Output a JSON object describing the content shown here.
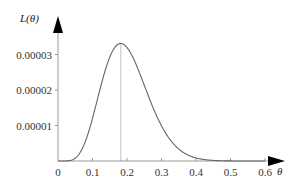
{
  "chart_data": {
    "type": "line",
    "title": "",
    "xlabel": "θ",
    "ylabel": "L(θ)",
    "xlim": [
      0,
      0.63
    ],
    "ylim": [
      0,
      3.7e-05
    ],
    "grid": false,
    "legend": null,
    "x_ticks": [
      0,
      0.1,
      0.2,
      0.3,
      0.4,
      0.5,
      0.6
    ],
    "x_tick_labels": [
      "0",
      "0.1",
      "0.2",
      "0.3",
      "0.4",
      "0.5",
      "0.6"
    ],
    "y_ticks": [
      1e-05,
      2e-05,
      3e-05
    ],
    "y_tick_labels": [
      "0.00001",
      "0.00002",
      "0.00003"
    ],
    "annotations": [
      {
        "type": "vertical-line",
        "x": 0.182,
        "label": "maximum",
        "note": "line from axis to curve peak"
      }
    ],
    "series": [
      {
        "name": "L(θ)",
        "x": [
          0,
          0.02,
          0.04,
          0.05,
          0.06,
          0.08,
          0.1,
          0.12,
          0.14,
          0.16,
          0.18,
          0.182,
          0.2,
          0.22,
          0.24,
          0.26,
          0.28,
          0.3,
          0.32,
          0.34,
          0.36,
          0.38,
          0.4,
          0.42,
          0.44,
          0.46,
          0.48,
          0.5,
          0.55,
          0.6
        ],
        "values": [
          0,
          0.0,
          2e-07,
          8e-07,
          2e-06,
          6.2e-06,
          1.2e-05,
          1.86e-05,
          2.5e-05,
          3e-05,
          3.3e-05,
          3.31e-05,
          3.23e-05,
          2.97e-05,
          2.62e-05,
          2.22e-05,
          1.8e-05,
          1.4e-05,
          1.06e-05,
          7.7e-06,
          5.5e-06,
          3.7e-06,
          2.5e-06,
          1.6e-06,
          1e-06,
          6e-07,
          4e-07,
          2e-07,
          0.0,
          0.0
        ]
      }
    ]
  },
  "colors": {
    "axis": "#999999",
    "curve": "#666666",
    "marker_line": "#cccccc",
    "arrow": "#000000"
  }
}
